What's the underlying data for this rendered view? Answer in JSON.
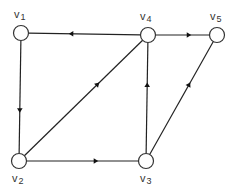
{
  "graph": {
    "type": "directed",
    "nodes": [
      {
        "id": "v1",
        "base": "v",
        "sub": "1"
      },
      {
        "id": "v2",
        "base": "v",
        "sub": "2"
      },
      {
        "id": "v3",
        "base": "v",
        "sub": "3"
      },
      {
        "id": "v4",
        "base": "v",
        "sub": "4"
      },
      {
        "id": "v5",
        "base": "v",
        "sub": "5"
      }
    ],
    "edges": [
      {
        "from": "v4",
        "to": "v1"
      },
      {
        "from": "v1",
        "to": "v2"
      },
      {
        "from": "v2",
        "to": "v3"
      },
      {
        "from": "v2",
        "to": "v4"
      },
      {
        "from": "v3",
        "to": "v4"
      },
      {
        "from": "v4",
        "to": "v5"
      },
      {
        "from": "v3",
        "to": "v5"
      }
    ]
  },
  "colors": {
    "stroke": "#222222",
    "node_fill": "#ffffff"
  }
}
